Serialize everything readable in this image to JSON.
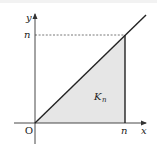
{
  "diagram": {
    "type": "coordinate-plot",
    "axes": {
      "x_label": "x",
      "y_label": "y",
      "origin_label": "O"
    },
    "ticks": {
      "x_tick_label": "n",
      "y_tick_label": "n"
    },
    "region": {
      "label_main": "K",
      "label_sub": "n",
      "fill_color": "#e6e6e6"
    },
    "colors": {
      "line": "#222222",
      "axis": "#333333",
      "dashed": "#555555",
      "background": "#ffffff"
    },
    "geometry": {
      "origin": [
        35,
        123
      ],
      "corner_nn": [
        125,
        35
      ],
      "line_end": [
        146,
        15
      ]
    }
  }
}
